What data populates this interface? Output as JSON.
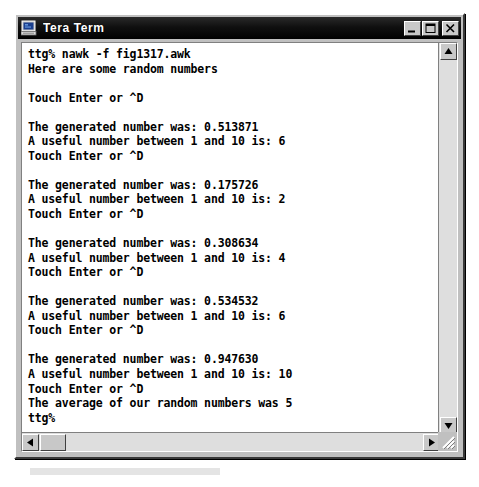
{
  "window": {
    "title": "Tera Term",
    "icon": "terminal-computer-icon",
    "controls": {
      "minimize": "minimize-icon",
      "maximize": "maximize-icon",
      "close": "close-icon"
    }
  },
  "terminal": {
    "prompt": "ttg%",
    "lines": [
      "ttg% nawk -f fig1317.awk",
      "Here are some random numbers",
      "",
      "Touch Enter or ^D",
      "",
      "The generated number was: 0.513871",
      "A useful number between 1 and 10 is: 6",
      "Touch Enter or ^D",
      "",
      "The generated number was: 0.175726",
      "A useful number between 1 and 10 is: 2",
      "Touch Enter or ^D",
      "",
      "The generated number was: 0.308634",
      "A useful number between 1 and 10 is: 4",
      "Touch Enter or ^D",
      "",
      "The generated number was: 0.534532",
      "A useful number between 1 and 10 is: 6",
      "Touch Enter or ^D",
      "",
      "The generated number was: 0.947630",
      "A useful number between 1 and 10 is: 10",
      "Touch Enter or ^D",
      "The average of our random numbers was 5",
      "ttg%"
    ]
  },
  "scrollbars": {
    "vertical": {
      "up_icon": "scroll-up-arrow-icon",
      "down_icon": "scroll-down-arrow-icon"
    },
    "horizontal": {
      "left_icon": "scroll-left-arrow-icon",
      "right_icon": "scroll-right-arrow-icon"
    }
  },
  "colors": {
    "titlebar": "#000000",
    "window_face": "#c0c0c0",
    "terminal_bg": "#ffffff",
    "terminal_fg": "#000000",
    "scroll_track": "#dedede"
  }
}
